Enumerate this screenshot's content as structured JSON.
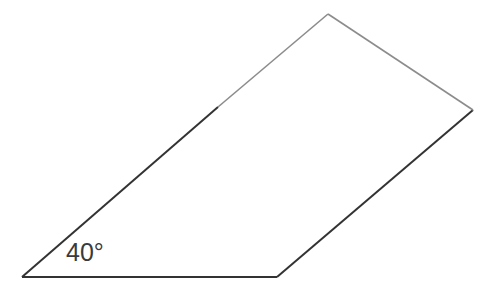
{
  "diagram": {
    "shape": "quadrilateral",
    "vertices": {
      "bottom_left": [
        22,
        277
      ],
      "bottom_right": [
        277,
        277
      ],
      "right": [
        473,
        110
      ],
      "top": [
        328,
        14
      ]
    },
    "angle_label": "40°",
    "colors": {
      "dark_edge": "#333333",
      "light_edge": "#8c8c8c",
      "label": "#3a3a3a",
      "background": "#ffffff"
    }
  }
}
